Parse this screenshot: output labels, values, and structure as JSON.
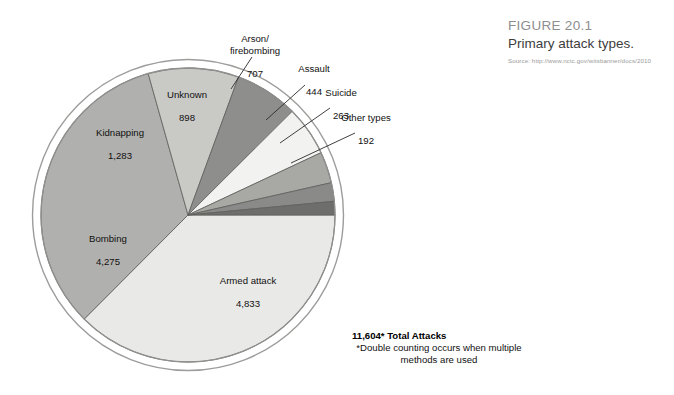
{
  "figure": {
    "number": "FIGURE 20.1",
    "title": "Primary attack types.",
    "source": "Source: http://www.nctc.gov/witsbanner/docs/2010"
  },
  "total": {
    "headline": "11,604* Total Attacks",
    "footnote": "*Double counting occurs when multiple methods are used"
  },
  "chart_data": {
    "type": "pie",
    "title": "Primary attack types.",
    "total_label": "11,604* Total Attacks",
    "total_value": 11604,
    "legend": "none",
    "labels": [
      "Armed attack",
      "Bombing",
      "Kidnapping",
      "Unknown",
      "Arson/\nfirebombing",
      "Assault",
      "Suicide",
      "Other types"
    ],
    "values": [
      4833,
      4275,
      1283,
      898,
      707,
      444,
      263,
      192
    ],
    "value_labels": [
      "4,833",
      "4,275",
      "1,283",
      "898",
      "707",
      "444",
      "263",
      "192"
    ],
    "colors": [
      "#e9e9e7",
      "#b0b0ae",
      "#c9c9c6",
      "#8e8e8c",
      "#f2f2f0",
      "#a8a8a5",
      "#8a8a88",
      "#6e6e6c"
    ],
    "slices": [
      {
        "name": "Armed attack",
        "value": 4833,
        "value_label": "4,833",
        "color": "#e9e9e7"
      },
      {
        "name": "Bombing",
        "value": 4275,
        "value_label": "4,275",
        "color": "#b0b0ae"
      },
      {
        "name": "Kidnapping",
        "value": 1283,
        "value_label": "1,283",
        "color": "#c9c9c6"
      },
      {
        "name": "Unknown",
        "value": 898,
        "value_label": "898",
        "color": "#8e8e8c"
      },
      {
        "name": "Arson/ firebombing",
        "value": 707,
        "value_label": "707",
        "color": "#f2f2f0"
      },
      {
        "name": "Assault",
        "value": 444,
        "value_label": "444",
        "color": "#a8a8a5"
      },
      {
        "name": "Suicide",
        "value": 263,
        "value_label": "263",
        "color": "#8a8a88"
      },
      {
        "name": "Other types",
        "value": 192,
        "value_label": "192",
        "color": "#6e6e6c"
      }
    ]
  },
  "labels": {
    "arson": {
      "name": "Arson/\nfirebombing",
      "value": "707"
    },
    "assault": {
      "name": "Assault",
      "value": "444"
    },
    "suicide": {
      "name": "Suicide",
      "value": "263"
    },
    "other": {
      "name": "Other types",
      "value": "192"
    },
    "unknown": {
      "name": "Unknown",
      "value": "898"
    },
    "kidnapping": {
      "name": "Kidnapping",
      "value": "1,283"
    },
    "bombing": {
      "name": "Bombing",
      "value": "4,275"
    },
    "armed": {
      "name": "Armed attack",
      "value": "4,833"
    }
  }
}
